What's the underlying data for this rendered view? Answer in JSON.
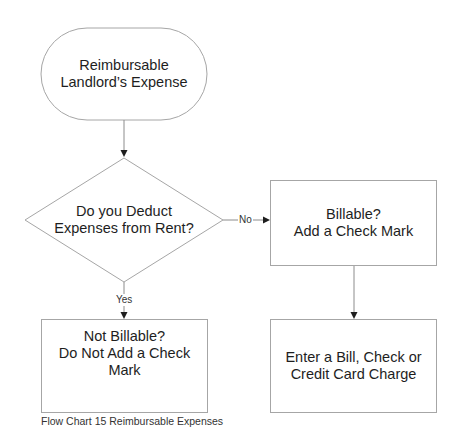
{
  "diagram": {
    "type": "flowchart",
    "stroke_color": "#a6a6a6",
    "arrow_color": "#1e1e1e",
    "nodes": {
      "start": {
        "shape": "terminator",
        "lines": [
          "Reimbursable",
          "Landlord’s Expense"
        ]
      },
      "decision": {
        "shape": "diamond",
        "lines": [
          "Do you Deduct",
          "Expenses from Rent?"
        ]
      },
      "billable": {
        "shape": "process",
        "lines": [
          "Billable?",
          "Add a Check Mark"
        ]
      },
      "not_billable": {
        "shape": "process",
        "lines": [
          "Not Billable?",
          "Do Not Add a Check",
          "Mark"
        ]
      },
      "enter": {
        "shape": "process",
        "lines": [
          "Enter a Bill, Check or",
          "Credit Card Charge"
        ]
      }
    },
    "edges": [
      {
        "from": "start",
        "to": "decision",
        "label": ""
      },
      {
        "from": "decision",
        "to": "billable",
        "label": "No"
      },
      {
        "from": "decision",
        "to": "not_billable",
        "label": "Yes"
      },
      {
        "from": "billable",
        "to": "enter",
        "label": ""
      }
    ],
    "edge_labels": {
      "no": "No",
      "yes": "Yes"
    },
    "caption": "Flow Chart 15 Reimbursable Expenses"
  }
}
